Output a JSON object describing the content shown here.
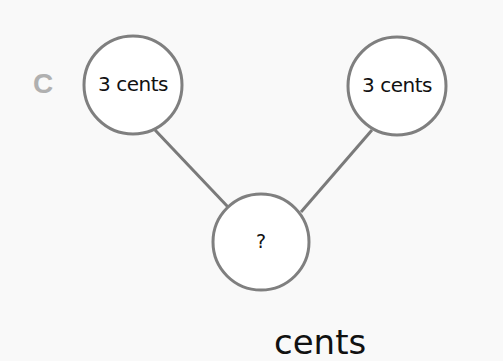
{
  "problem": {
    "label": "C",
    "nodes": {
      "top_left": "3 cents",
      "top_right": "3 cents",
      "bottom": "?"
    },
    "answer_unit": "cents"
  },
  "colors": {
    "label": "#b0b0b0",
    "circle_stroke": "#7f7f7f",
    "line": "#7a7a7a",
    "text": "#111111",
    "background": "#f9f9f9"
  }
}
